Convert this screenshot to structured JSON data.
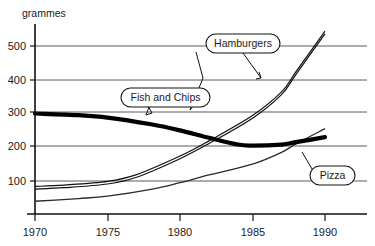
{
  "chart_data": {
    "type": "line",
    "title": "",
    "subtitle": "",
    "xlabel": "",
    "ylabel": "grammes",
    "x": [
      1970,
      1975,
      1980,
      1985,
      1990
    ],
    "xlim": [
      1970,
      1991
    ],
    "ylim": [
      0,
      560
    ],
    "yticks": [
      100,
      200,
      300,
      400,
      500
    ],
    "xticks": [
      1970,
      1975,
      1980,
      1985,
      1990
    ],
    "ytick_labels": [
      "100",
      "200",
      "300",
      "400",
      "500"
    ],
    "xtick_labels": [
      "1970",
      "1975",
      "1980",
      "1985",
      "1990"
    ],
    "grid": true,
    "legend_position": "inline-callouts",
    "series": [
      {
        "name": "Fish and Chips",
        "style": "thick-black",
        "values": [
          300,
          290,
          250,
          205,
          230
        ],
        "points": [
          {
            "x": 1970,
            "y": 300
          },
          {
            "x": 1973,
            "y": 295
          },
          {
            "x": 1975,
            "y": 288
          },
          {
            "x": 1978,
            "y": 268
          },
          {
            "x": 1980,
            "y": 250
          },
          {
            "x": 1982,
            "y": 228
          },
          {
            "x": 1984,
            "y": 208
          },
          {
            "x": 1985,
            "y": 205
          },
          {
            "x": 1987,
            "y": 208
          },
          {
            "x": 1988,
            "y": 215
          },
          {
            "x": 1990,
            "y": 230
          }
        ]
      },
      {
        "name": "Hamburgers",
        "style": "thin-double",
        "values": [
          80,
          95,
          170,
          290,
          540
        ],
        "points": [
          {
            "x": 1970,
            "y": 80
          },
          {
            "x": 1972,
            "y": 84
          },
          {
            "x": 1975,
            "y": 95
          },
          {
            "x": 1977,
            "y": 115
          },
          {
            "x": 1980,
            "y": 170
          },
          {
            "x": 1982,
            "y": 215
          },
          {
            "x": 1985,
            "y": 290
          },
          {
            "x": 1987,
            "y": 360
          },
          {
            "x": 1988,
            "y": 420
          },
          {
            "x": 1990,
            "y": 540
          }
        ]
      },
      {
        "name": "Pizza",
        "style": "thin-grey",
        "values": [
          40,
          55,
          95,
          150,
          255
        ],
        "points": [
          {
            "x": 1970,
            "y": 40
          },
          {
            "x": 1973,
            "y": 48
          },
          {
            "x": 1975,
            "y": 55
          },
          {
            "x": 1978,
            "y": 75
          },
          {
            "x": 1980,
            "y": 95
          },
          {
            "x": 1982,
            "y": 118
          },
          {
            "x": 1985,
            "y": 150
          },
          {
            "x": 1987,
            "y": 185
          },
          {
            "x": 1988,
            "y": 210
          },
          {
            "x": 1990,
            "y": 255
          }
        ]
      }
    ],
    "annotations": [
      {
        "label": "Hamburgers",
        "target_x": 1985,
        "target_y": 290
      },
      {
        "label": "Fish and Chips",
        "target_x": 1979,
        "target_y": 258
      },
      {
        "label": "Pizza",
        "target_x": 1987,
        "target_y": 190
      }
    ],
    "colors": {
      "line": "#111111",
      "grid": "#555555",
      "axis": "#111111",
      "background": "#ffffff"
    }
  },
  "callouts": {
    "hamburgers": "Hamburgers",
    "fish_and_chips": "Fish and Chips",
    "pizza": "Pizza"
  }
}
